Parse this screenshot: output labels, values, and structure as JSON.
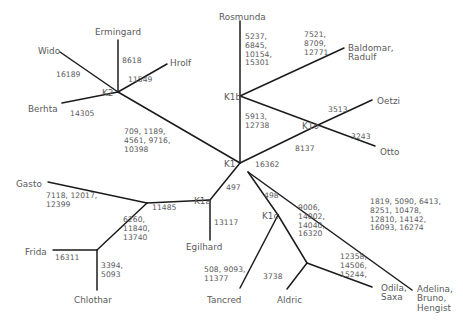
{
  "figure": {
    "type": "phylogenetic-network",
    "stroke_color": "#1b1b1b",
    "text_color": "#59595b",
    "background": "#ffffff"
  },
  "nodes": [
    {
      "id": "K2",
      "label": "K2",
      "x": 118,
      "y": 92
    },
    {
      "id": "K1",
      "label": "K1",
      "x": 240,
      "y": 163
    },
    {
      "id": "K1b",
      "label": "K1b",
      "x": 240,
      "y": 96
    },
    {
      "id": "K1o",
      "label": "K1o",
      "x": 318,
      "y": 125
    },
    {
      "id": "K1a",
      "label": "K1a",
      "x": 210,
      "y": 200
    },
    {
      "id": "K1c",
      "label": "K1c",
      "x": 278,
      "y": 215
    },
    {
      "id": "n_gasto",
      "label": "",
      "x": 147,
      "y": 203
    },
    {
      "id": "n_frida",
      "label": "",
      "x": 97,
      "y": 250
    },
    {
      "id": "n_aldric",
      "label": "",
      "x": 307,
      "y": 263
    }
  ],
  "taxa": [
    {
      "name": "Wido",
      "x": 38,
      "y": 47
    },
    {
      "name": "Ermingard",
      "x": 95,
      "y": 28
    },
    {
      "name": "Hrolf",
      "x": 170,
      "y": 59
    },
    {
      "name": "Berhta",
      "x": 28,
      "y": 105
    },
    {
      "name": "Rosmunda",
      "x": 219,
      "y": 13
    },
    {
      "name": "Baldomar,\nRadulf",
      "x": 348,
      "y": 44
    },
    {
      "name": "Oetzi",
      "x": 377,
      "y": 97
    },
    {
      "name": "Otto",
      "x": 380,
      "y": 148
    },
    {
      "name": "Gasto",
      "x": 16,
      "y": 180
    },
    {
      "name": "Frida",
      "x": 25,
      "y": 248
    },
    {
      "name": "Chlothar",
      "x": 74,
      "y": 296
    },
    {
      "name": "Egilhard",
      "x": 186,
      "y": 243
    },
    {
      "name": "Tancred",
      "x": 207,
      "y": 296
    },
    {
      "name": "Aldric",
      "x": 277,
      "y": 296
    },
    {
      "name": "Odila,\nSaxa",
      "x": 381,
      "y": 284
    },
    {
      "name": "Adelina,\nBruno,\nHengist",
      "x": 417,
      "y": 285
    }
  ],
  "branches": [
    {
      "from": "Wido",
      "to": "K2",
      "mutations": "16189",
      "x1": 60,
      "y1": 52,
      "x2": 118,
      "y2": 92,
      "label_x": 56,
      "label_y": 71
    },
    {
      "from": "Ermingard",
      "to": "K2",
      "mutations": "8618",
      "x1": 118,
      "y1": 40,
      "x2": 118,
      "y2": 92,
      "label_x": 122,
      "label_y": 57
    },
    {
      "from": "Hrolf",
      "to": "K2",
      "mutations": "11549",
      "x1": 167,
      "y1": 64,
      "x2": 118,
      "y2": 92,
      "label_x": 128,
      "label_y": 76
    },
    {
      "from": "Berhta",
      "to": "K2",
      "mutations": "14305",
      "x1": 62,
      "y1": 103,
      "x2": 118,
      "y2": 92,
      "label_x": 70,
      "label_y": 110
    },
    {
      "from": "K2",
      "to": "K1",
      "mutations": "709, 1189,\n4561, 9716,\n10398",
      "x1": 118,
      "y1": 92,
      "x2": 240,
      "y2": 163,
      "label_x": 124,
      "label_y": 128
    },
    {
      "from": "Rosmunda",
      "to": "K1b",
      "mutations": "5237,\n6845,\n10154,\n15301",
      "x1": 240,
      "y1": 21,
      "x2": 240,
      "y2": 96,
      "label_x": 245,
      "label_y": 33
    },
    {
      "from": "Baldomar, Radulf",
      "to": "K1b",
      "mutations": "7521,\n8709,\n12771",
      "x1": 344,
      "y1": 48,
      "x2": 240,
      "y2": 96,
      "label_x": 304,
      "label_y": 31
    },
    {
      "from": "K1b",
      "to": "K1",
      "mutations": "5913,\n12738",
      "x1": 240,
      "y1": 96,
      "x2": 240,
      "y2": 163,
      "label_x": 245,
      "label_y": 113
    },
    {
      "from": "K1b",
      "to": "K1o",
      "mutations": "8137",
      "x1": 240,
      "y1": 96,
      "x2": 318,
      "y2": 125,
      "label_x": 295,
      "label_y": 145
    },
    {
      "from": "Oetzi",
      "to": "K1o",
      "mutations": "3513",
      "x1": 372,
      "y1": 100,
      "x2": 318,
      "y2": 125,
      "label_x": 328,
      "label_y": 106
    },
    {
      "from": "Otto",
      "to": "K1o",
      "mutations": "3243",
      "x1": 375,
      "y1": 146,
      "x2": 318,
      "y2": 125,
      "label_x": 351,
      "label_y": 133
    },
    {
      "from": "K1o",
      "to": "K1",
      "mutations": "16362",
      "x1": 318,
      "y1": 125,
      "x2": 240,
      "y2": 163,
      "label_x": 255,
      "label_y": 161
    },
    {
      "from": "K1a",
      "to": "K1",
      "mutations": "497",
      "x1": 210,
      "y1": 200,
      "x2": 240,
      "y2": 163,
      "label_x": 226,
      "label_y": 184
    },
    {
      "from": "Egilhard",
      "to": "K1a",
      "mutations": "13117",
      "x1": 210,
      "y1": 240,
      "x2": 210,
      "y2": 200,
      "label_x": 214,
      "label_y": 219
    },
    {
      "from": "n_gasto",
      "to": "K1a",
      "mutations": "11485",
      "x1": 147,
      "y1": 203,
      "x2": 210,
      "y2": 200,
      "label_x": 152,
      "label_y": 204
    },
    {
      "from": "Gasto",
      "to": "n_gasto",
      "mutations": "7118, 12017,\n12399",
      "x1": 48,
      "y1": 182,
      "x2": 147,
      "y2": 203,
      "label_x": 46,
      "label_y": 192
    },
    {
      "from": "n_frida",
      "to": "n_gasto",
      "mutations": "6260,\n11840,\n13740",
      "x1": 97,
      "y1": 250,
      "x2": 147,
      "y2": 203,
      "label_x": 123,
      "label_y": 216
    },
    {
      "from": "Frida",
      "to": "n_frida",
      "mutations": "16311",
      "x1": 53,
      "y1": 250,
      "x2": 97,
      "y2": 250,
      "label_x": 55,
      "label_y": 254
    },
    {
      "from": "Chlothar",
      "to": "n_frida",
      "mutations": "3394,\n5093",
      "x1": 97,
      "y1": 290,
      "x2": 97,
      "y2": 250,
      "label_x": 101,
      "label_y": 262
    },
    {
      "from": "K1c",
      "to": "K1",
      "mutations": "498",
      "x1": 278,
      "y1": 215,
      "x2": 248,
      "y2": 172,
      "label_x": 264,
      "label_y": 192
    },
    {
      "from": "Tancred",
      "to": "K1c",
      "mutations": "508, 9093,\n11377",
      "x1": 240,
      "y1": 288,
      "x2": 278,
      "y2": 215,
      "label_x": 204,
      "label_y": 266
    },
    {
      "from": "n_aldric",
      "to": "K1c",
      "mutations": "9006,\n14002,\n14040,\n16320",
      "x1": 307,
      "y1": 263,
      "x2": 278,
      "y2": 215,
      "label_x": 298,
      "label_y": 204
    },
    {
      "from": "Aldric",
      "to": "n_aldric",
      "mutations": "3738",
      "x1": 287,
      "y1": 289,
      "x2": 307,
      "y2": 263,
      "label_x": 263,
      "label_y": 273
    },
    {
      "from": "Odila, Saxa",
      "to": "n_aldric",
      "mutations": "12358,\n14506,\n15244,",
      "x1": 372,
      "y1": 287,
      "x2": 307,
      "y2": 263,
      "label_x": 340,
      "label_y": 253
    },
    {
      "from": "Adelina, Bruno, Hengist",
      "to": "K1",
      "mutations": "1819, 5090, 6413,\n8251, 10478,\n12810, 14142,\n16093, 16274",
      "x1": 412,
      "y1": 290,
      "x2": 248,
      "y2": 172,
      "label_x": 370,
      "label_y": 198
    }
  ]
}
